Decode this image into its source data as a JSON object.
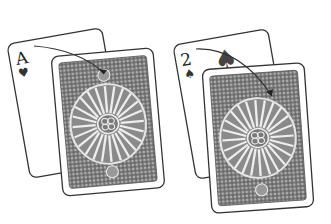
{
  "illustration": {
    "description": "Two playing-card arrangements, each showing a face card partially covered by a patterned card back, with a curved arrow from the face card's index corner onto the back",
    "groups": [
      {
        "face_card": {
          "rank": "A",
          "suit": "heart",
          "suit_glyph": "♥"
        },
        "back_card": {
          "pattern": "radial-sunburst"
        },
        "arrow": {
          "from": "index-corner",
          "to": "back-card-top-center"
        }
      },
      {
        "face_card": {
          "rank": "2",
          "suit": "spade",
          "suit_glyph": "♠"
        },
        "back_card": {
          "pattern": "radial-sunburst"
        },
        "arrow": {
          "from": "index-corner",
          "to": "back-card-top-center"
        }
      }
    ],
    "colors": {
      "ink": "#333333",
      "card_face": "#ffffff",
      "back_fill": "#6e6e6e",
      "back_light": "#d8d8d8"
    }
  }
}
